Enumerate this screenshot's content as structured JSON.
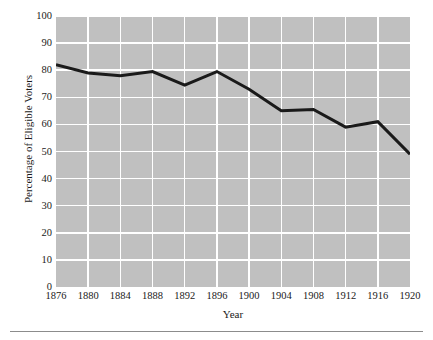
{
  "chart_data": {
    "type": "line",
    "title": "",
    "xlabel": "Year",
    "ylabel": "Percentage of Eligible Voters",
    "x": [
      1876,
      1880,
      1884,
      1888,
      1892,
      1896,
      1900,
      1904,
      1908,
      1912,
      1916,
      1920
    ],
    "values": [
      82,
      79,
      78,
      79.5,
      74.5,
      79.5,
      73,
      65,
      65.5,
      59,
      61,
      49
    ],
    "series": [
      {
        "name": "Percentage of Eligible Voters",
        "values": [
          82,
          79,
          78,
          79.5,
          74.5,
          79.5,
          73,
          65,
          65.5,
          59,
          61,
          49
        ]
      }
    ],
    "xlim": [
      1876,
      1920
    ],
    "ylim": [
      0,
      100
    ],
    "ytick_labels": [
      "0",
      "10",
      "20",
      "30",
      "40",
      "50",
      "60",
      "70",
      "80",
      "90",
      "100"
    ],
    "ytick_values": [
      0,
      10,
      20,
      30,
      40,
      50,
      60,
      70,
      80,
      90,
      100
    ],
    "xtick_labels": [
      "1876",
      "1880",
      "1884",
      "1888",
      "1892",
      "1896",
      "1900",
      "1904",
      "1908",
      "1912",
      "1916",
      "1920"
    ],
    "xtick_values": [
      1876,
      1880,
      1884,
      1888,
      1892,
      1896,
      1900,
      1904,
      1908,
      1912,
      1916,
      1920
    ],
    "grid": true,
    "grid_color": "#ffffff",
    "plot_background": "#c0c0c0",
    "line_color": "#1a1a1a",
    "line_width": 3,
    "legend": false,
    "legend_position": "none",
    "annotations": []
  }
}
